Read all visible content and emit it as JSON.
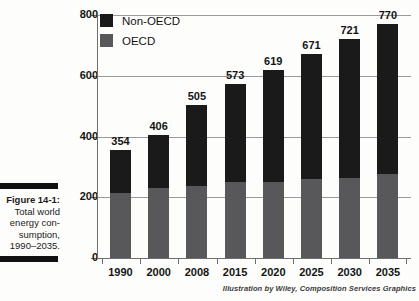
{
  "figure": {
    "label": "Figure 14-1:",
    "caption_lines": [
      "Total world",
      "energy con-",
      "sumption,",
      "1990–2035."
    ]
  },
  "credit": "Illustration by Wiley, Composition Services Graphics",
  "colors": {
    "non_oecd": "#1a1a1a",
    "oecd": "#58585a",
    "gridline": "#9a9a9a",
    "axis": "#6e6e6e",
    "text": "#141414",
    "background": "#fdfdfb"
  },
  "chart_data": {
    "type": "bar",
    "title": "",
    "subtitle": "",
    "xlabel": "",
    "ylabel": "",
    "stacked": true,
    "grid": true,
    "legend_position": "top-left",
    "ylim": [
      0,
      800
    ],
    "yticks": [
      0,
      200,
      400,
      600,
      800
    ],
    "categories": [
      "1990",
      "2000",
      "2008",
      "2015",
      "2020",
      "2025",
      "2030",
      "2035"
    ],
    "series": [
      {
        "name": "OECD",
        "color": "#58585a",
        "values": [
          214,
          232,
          238,
          249,
          251,
          259,
          264,
          277
        ]
      },
      {
        "name": "Non-OECD",
        "color": "#1a1a1a",
        "values": [
          140,
          174,
          267,
          324,
          368,
          412,
          457,
          493
        ]
      }
    ],
    "totals": [
      354,
      406,
      505,
      573,
      619,
      671,
      721,
      770
    ],
    "total_labels": [
      "354",
      "406",
      "505",
      "573",
      "619",
      "671",
      "721",
      "770"
    ],
    "legend": [
      "Non-OECD",
      "OECD"
    ]
  }
}
